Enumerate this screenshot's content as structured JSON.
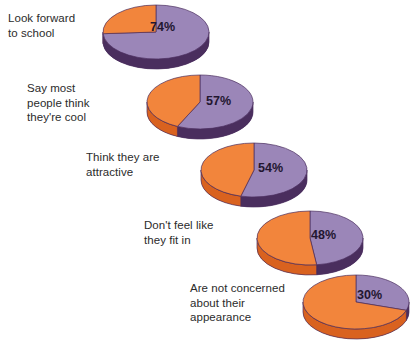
{
  "chart_data": {
    "type": "pie",
    "title": "",
    "xlabel": "",
    "ylabel": "",
    "legend": [],
    "colors": {
      "highlight_slice": "#9b86b8",
      "remainder_slice": "#f2853c",
      "highlight_rim": "#4a2e5e",
      "remainder_rim": "#d9621f",
      "slice_outline": "#4a2e5e",
      "label_text": "#2b2b2b",
      "value_text": "#231630",
      "background": "#ffffff"
    },
    "series_note": "Each pie shows one percentage (purple, clockwise from 12 o'clock) and its remainder (orange).",
    "charts": [
      {
        "label": "Look forward\nto school",
        "value": 74,
        "value_text": "74%",
        "remainder": 26
      },
      {
        "label": "Say most\npeople think\nthey're cool",
        "value": 57,
        "value_text": "57%",
        "remainder": 43
      },
      {
        "label": "Think they are\nattractive",
        "value": 54,
        "value_text": "54%",
        "remainder": 46
      },
      {
        "label": "Don't feel like\nthey fit in",
        "value": 48,
        "value_text": "48%",
        "remainder": 52
      },
      {
        "label": "Are not concerned\nabout their\nappearance",
        "value": 30,
        "value_text": "30%",
        "remainder": 70
      }
    ]
  }
}
